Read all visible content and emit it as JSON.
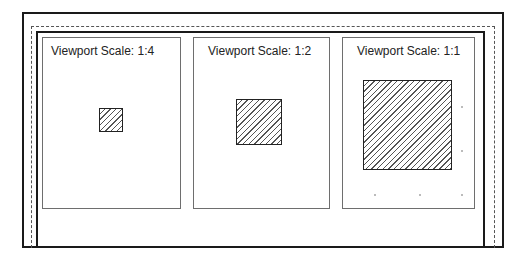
{
  "diagram": {
    "viewports": [
      {
        "title": "Viewport Scale: 1:4",
        "scale": "1:4"
      },
      {
        "title": "Viewport Scale: 1:2",
        "scale": "1:2"
      },
      {
        "title": "Viewport Scale: 1:1",
        "scale": "1:1"
      }
    ],
    "colors": {
      "frame": "#1a1a1a",
      "dashed": "#555555",
      "viewport_border": "#6e6e6e",
      "hatch": "#555555"
    }
  }
}
